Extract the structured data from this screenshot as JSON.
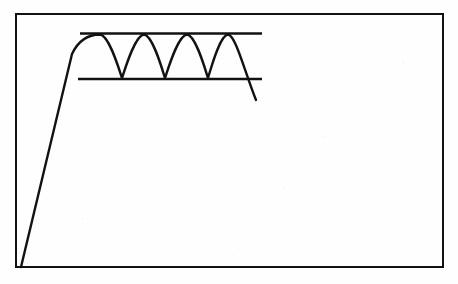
{
  "figure": {
    "caption_fragment": "",
    "background_color": "#fefefe",
    "ink_color": "#121212"
  },
  "chart_data": {
    "type": "line",
    "title": "",
    "subtitle": "",
    "xlabel": "",
    "ylabel": "",
    "grid": false,
    "legend": null,
    "axis_frame": {
      "style": "full-box-border",
      "color": "#121212",
      "stroke_width": 2.4,
      "left": 16,
      "top": 14,
      "right": 443,
      "bottom": 267,
      "x_ticks": [],
      "y_ticks": [],
      "x_tick_labels": [],
      "y_tick_labels": []
    },
    "xlim": [
      0,
      458
    ],
    "ylim_pixels": [
      284,
      0
    ],
    "annotations": [
      {
        "name": "upper-envelope-line",
        "kind": "horizontal-reference-line",
        "label": "",
        "y": 33.5,
        "x_start": 80,
        "x_end": 262,
        "stroke_width": 2.6,
        "color": "#121212"
      },
      {
        "name": "lower-envelope-line",
        "kind": "horizontal-reference-line",
        "label": "",
        "y": 79.0,
        "x_start": 78,
        "x_end": 262,
        "stroke_width": 2.6,
        "color": "#121212"
      }
    ],
    "series": [
      {
        "name": "signal",
        "label": "",
        "color": "#121212",
        "stroke_width": 2.4,
        "description": "Steep linear rise from bottom-left, then a sustained four-cycle oscillation bounded by the two horizontal envelope lines, followed by a steep fall through both lines.",
        "segments": [
          {
            "name": "rising-ramp",
            "kind": "line",
            "points": [
              [
                21,
                267
              ],
              [
                72,
                54
              ]
            ]
          },
          {
            "name": "oscillation",
            "kind": "smooth-wave",
            "peak_y": 34.5,
            "trough_y": 78.0,
            "peaks_x": [
              100,
              144,
              187,
              228
            ],
            "troughs_x": [
              122,
              165,
              208
            ],
            "cycles": 4,
            "start_x": 72,
            "start_y": 54
          },
          {
            "name": "falling-tail",
            "kind": "line",
            "points": [
              [
                228,
                34.5
              ],
              [
                256,
                100
              ]
            ]
          }
        ]
      }
    ]
  }
}
